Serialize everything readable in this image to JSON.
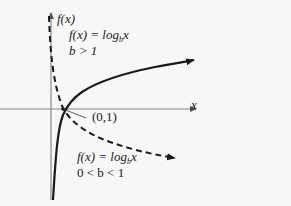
{
  "axes": {
    "y_label": "f(x)",
    "x_label": "x"
  },
  "point": {
    "label": "(0,1)"
  },
  "curve_increasing": {
    "line1_prefix": "f(x) = log",
    "line1_base": "b",
    "line1_arg": "x",
    "line2": "b > 1",
    "style": "solid"
  },
  "curve_decreasing": {
    "line1_prefix": "f(x) = log",
    "line1_base": "b",
    "line1_arg": "x",
    "line2": "0 < b < 1",
    "style": "dashed"
  },
  "colors": {
    "background": "#f7f7f7",
    "axis": "#777777",
    "curve": "#1a1a1a"
  }
}
